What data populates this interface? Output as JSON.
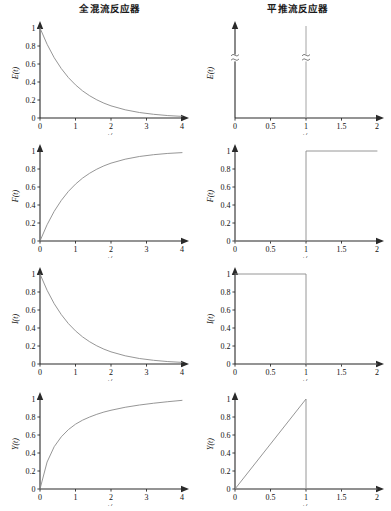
{
  "titles": {
    "left": "全混流反应器",
    "right": "平推流反应器"
  },
  "axis_labels": {
    "x": "t/τ",
    "e": "E(t)",
    "f": "F(t)",
    "i": "I(t)",
    "y": "Y(t)"
  },
  "ticks": {
    "x_left": [
      "0",
      "1",
      "2",
      "3",
      "4"
    ],
    "x_right": [
      "0",
      "0.5",
      "1",
      "1.5",
      "2"
    ],
    "y_full": [
      "0",
      "0.2",
      "0.4",
      "0.6",
      "0.8",
      "1"
    ],
    "y_sparse": [
      "1"
    ]
  },
  "colors": {
    "axis": "#2a2a2a",
    "curve": "#8a8a8a",
    "text": "#111111",
    "background": "#ffffff"
  },
  "chart_data": [
    {
      "id": "cstr-e",
      "type": "line",
      "title": "全混流反应器",
      "xlabel": "t/τ",
      "ylabel": "E(t)",
      "xlim": [
        0,
        4
      ],
      "ylim": [
        0,
        1
      ],
      "xticks": [
        0,
        1,
        2,
        3,
        4
      ],
      "yticks": [
        0,
        0.2,
        0.4,
        0.6,
        0.8,
        1
      ],
      "grid": false,
      "legend": "none",
      "formula": "E(t) = exp(-t/τ)",
      "x": [
        0,
        0.2,
        0.4,
        0.6,
        0.8,
        1.0,
        1.2,
        1.4,
        1.6,
        1.8,
        2.0,
        2.4,
        2.8,
        3.2,
        3.6,
        4.0
      ],
      "values": [
        1.0,
        0.819,
        0.67,
        0.549,
        0.449,
        0.368,
        0.301,
        0.247,
        0.202,
        0.165,
        0.135,
        0.091,
        0.061,
        0.041,
        0.027,
        0.018
      ]
    },
    {
      "id": "pfr-e",
      "type": "line",
      "title": "平推流反应器",
      "xlabel": "t/τ",
      "ylabel": "E(t)",
      "xlim": [
        0,
        2
      ],
      "ylim": [
        0,
        1
      ],
      "xticks": [
        0,
        0.5,
        1,
        1.5,
        2
      ],
      "yticks": [],
      "grid": false,
      "legend": "none",
      "formula": "E(t) = δ(t - τ)",
      "impulse_at": 1,
      "axis_break": true,
      "x": [
        0,
        1,
        1,
        2
      ],
      "values": [
        0,
        0,
        1,
        0
      ]
    },
    {
      "id": "cstr-f",
      "type": "line",
      "title": "",
      "xlabel": "t/τ",
      "ylabel": "F(t)",
      "xlim": [
        0,
        4
      ],
      "ylim": [
        0,
        1
      ],
      "xticks": [
        0,
        1,
        2,
        3,
        4
      ],
      "yticks": [
        0,
        0.2,
        0.4,
        0.6,
        0.8,
        1
      ],
      "grid": false,
      "legend": "none",
      "formula": "F(t) = 1 - exp(-t/τ)",
      "x": [
        0,
        0.2,
        0.4,
        0.6,
        0.8,
        1.0,
        1.2,
        1.4,
        1.6,
        1.8,
        2.0,
        2.4,
        2.8,
        3.2,
        3.6,
        4.0
      ],
      "values": [
        0.0,
        0.181,
        0.33,
        0.451,
        0.551,
        0.632,
        0.699,
        0.753,
        0.798,
        0.835,
        0.865,
        0.909,
        0.939,
        0.959,
        0.973,
        0.982
      ]
    },
    {
      "id": "pfr-f",
      "type": "line",
      "title": "",
      "xlabel": "t/τ",
      "ylabel": "F(t)",
      "xlim": [
        0,
        2
      ],
      "ylim": [
        0,
        1
      ],
      "xticks": [
        0,
        0.5,
        1,
        1.5,
        2
      ],
      "yticks": [
        0,
        0.2,
        0.4,
        0.6,
        0.8,
        1
      ],
      "grid": false,
      "legend": "none",
      "formula": "F(t) = step at t/τ = 1",
      "x": [
        0,
        1,
        1,
        2
      ],
      "values": [
        0,
        0,
        1,
        1
      ]
    },
    {
      "id": "cstr-i",
      "type": "line",
      "title": "",
      "xlabel": "t/τ",
      "ylabel": "I(t)",
      "xlim": [
        0,
        4
      ],
      "ylim": [
        0,
        1
      ],
      "xticks": [
        0,
        1,
        2,
        3,
        4
      ],
      "yticks": [
        0,
        0.2,
        0.4,
        0.6,
        0.8,
        1
      ],
      "grid": false,
      "legend": "none",
      "formula": "I(t) = exp(-t/τ)",
      "x": [
        0,
        0.2,
        0.4,
        0.6,
        0.8,
        1.0,
        1.2,
        1.4,
        1.6,
        1.8,
        2.0,
        2.4,
        2.8,
        3.2,
        3.6,
        4.0
      ],
      "values": [
        1.0,
        0.819,
        0.67,
        0.549,
        0.449,
        0.368,
        0.301,
        0.247,
        0.202,
        0.165,
        0.135,
        0.091,
        0.061,
        0.041,
        0.027,
        0.018
      ]
    },
    {
      "id": "pfr-i",
      "type": "line",
      "title": "",
      "xlabel": "t/τ",
      "ylabel": "I(t)",
      "xlim": [
        0,
        2
      ],
      "ylim": [
        0,
        1
      ],
      "xticks": [
        0,
        0.5,
        1,
        1.5,
        2
      ],
      "yticks": [
        0,
        0.2,
        0.4,
        0.6,
        0.8,
        1
      ],
      "grid": false,
      "legend": "none",
      "formula": "I(t) = 1 until t/τ = 1, then 0",
      "x": [
        0,
        1,
        1,
        2
      ],
      "values": [
        1,
        1,
        0,
        0
      ]
    },
    {
      "id": "cstr-y",
      "type": "line",
      "title": "",
      "xlabel": "t/τ",
      "ylabel": "Y(t)",
      "xlim": [
        0,
        4
      ],
      "ylim": [
        0,
        1
      ],
      "xticks": [
        0,
        1,
        2,
        3,
        4
      ],
      "yticks": [
        0,
        0.2,
        0.4,
        0.6,
        0.8,
        1
      ],
      "grid": false,
      "legend": "none",
      "formula": "Y(t) rising saturation curve",
      "x": [
        0,
        0.2,
        0.4,
        0.6,
        0.8,
        1.0,
        1.2,
        1.4,
        1.6,
        1.8,
        2.0,
        2.4,
        2.8,
        3.2,
        3.6,
        4.0
      ],
      "values": [
        0.0,
        0.3,
        0.47,
        0.58,
        0.66,
        0.72,
        0.765,
        0.8,
        0.83,
        0.855,
        0.875,
        0.908,
        0.933,
        0.953,
        0.97,
        0.985
      ]
    },
    {
      "id": "pfr-y",
      "type": "line",
      "title": "",
      "xlabel": "t/τ",
      "ylabel": "Y(t)",
      "xlim": [
        0,
        2
      ],
      "ylim": [
        0,
        1
      ],
      "xticks": [
        0,
        0.5,
        1,
        1.5,
        2
      ],
      "yticks": [
        0,
        0.2,
        0.4,
        0.6,
        0.8,
        1
      ],
      "grid": false,
      "legend": "none",
      "formula": "Y(t) = t/τ until 1, then 0",
      "x": [
        0,
        1,
        1,
        2
      ],
      "values": [
        0,
        1,
        0,
        0
      ]
    }
  ]
}
